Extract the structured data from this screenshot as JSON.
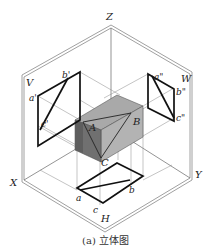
{
  "figure": {
    "caption": "(a) 立体图",
    "axes": {
      "z": "Z",
      "x": "X",
      "y": "Y"
    },
    "planes": {
      "v": "V",
      "w": "W",
      "h": "H"
    },
    "solid_points": {
      "a": "A",
      "b": "B",
      "c": "C"
    },
    "v_projection": {
      "a": "a'",
      "b": "b'",
      "c": "c'"
    },
    "w_projection": {
      "a": "a\"",
      "b": "b\"",
      "c": "c\""
    },
    "h_projection": {
      "a": "a",
      "b": "b",
      "c": "c"
    },
    "colors": {
      "line": "#222222",
      "frame": "#777777",
      "box_top": "#a8a8a8",
      "box_front": "#8a8a8a",
      "box_right": "#b4b4b4",
      "box_left": "#6e6e6e"
    }
  }
}
